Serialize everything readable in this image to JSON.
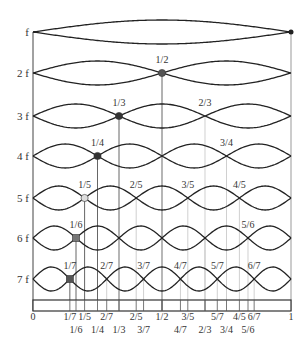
{
  "geometry": {
    "x0": 33,
    "x1": 291,
    "rows_y": [
      32,
      73,
      116,
      156,
      198,
      238,
      279
    ],
    "amplitude": 12,
    "bar": {
      "y": 300,
      "h": 11
    },
    "bottom_labels_y": [
      320,
      333
    ]
  },
  "colors": {
    "wave": "#222222",
    "guide": "#bbbbbb",
    "guide_dark": "#555555",
    "node_fill": [
      "#222222",
      "#555555",
      "#333333",
      "#333333",
      "#dddddd",
      "#777777",
      "#555555"
    ]
  },
  "harmonics": [
    {
      "label": "f",
      "n": 1,
      "node_labels": []
    },
    {
      "label": "2 f",
      "n": 2,
      "node_labels": [
        "1/2"
      ]
    },
    {
      "label": "3 f",
      "n": 3,
      "node_labels": [
        "1/3",
        "2/3"
      ]
    },
    {
      "label": "4 f",
      "n": 4,
      "node_labels": [
        "1/4",
        "",
        "3/4"
      ]
    },
    {
      "label": "5 f",
      "n": 5,
      "node_labels": [
        "1/5",
        "2/5",
        "3/5",
        "4/5"
      ]
    },
    {
      "label": "6 f",
      "n": 6,
      "node_labels": [
        "1/6",
        "",
        "",
        "",
        "5/6"
      ]
    },
    {
      "label": "7 f",
      "n": 7,
      "node_labels": [
        "1/7",
        "2/7",
        "3/7",
        "4/7",
        "5/7",
        "6/7"
      ]
    }
  ],
  "axis": {
    "start_label": "0",
    "end_label": "1",
    "row1": [
      "1/7",
      "1/5",
      "2/7",
      "2/5",
      "1/2",
      "3/5",
      "5/7",
      "4/5",
      "6/7"
    ],
    "row2": [
      "1/6",
      "1/4",
      "1/3",
      "3/7",
      "4/7",
      "2/3",
      "3/4",
      "5/6"
    ]
  }
}
